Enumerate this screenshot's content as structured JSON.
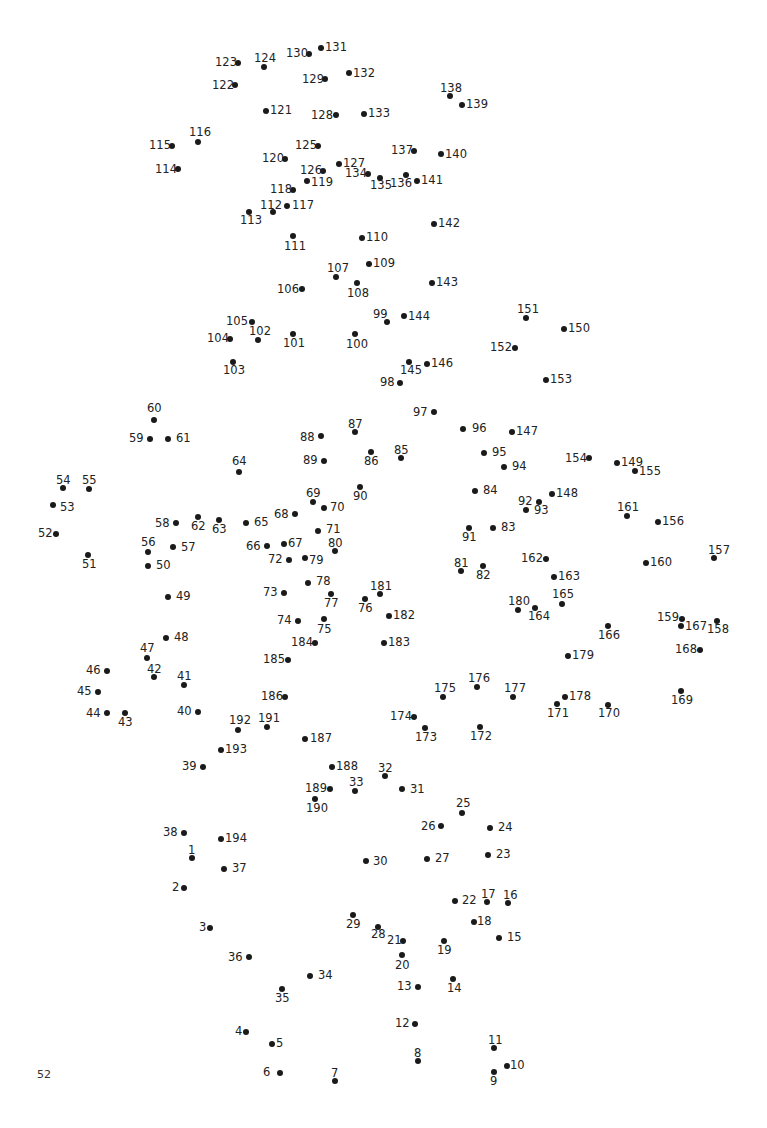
{
  "page": {
    "page_number": "52",
    "dot_color": "#1a1a1a",
    "text_color": "#222222"
  },
  "dots": [
    {
      "n": "1",
      "x": 192,
      "y": 858,
      "lx": 188,
      "ly": 845
    },
    {
      "n": "2",
      "x": 184,
      "y": 888,
      "lx": 172,
      "ly": 882
    },
    {
      "n": "3",
      "x": 210,
      "y": 928,
      "lx": 199,
      "ly": 922
    },
    {
      "n": "4",
      "x": 246,
      "y": 1032,
      "lx": 235,
      "ly": 1026
    },
    {
      "n": "5",
      "x": 272,
      "y": 1044,
      "lx": 276,
      "ly": 1038
    },
    {
      "n": "6",
      "x": 280,
      "y": 1073,
      "lx": 263,
      "ly": 1067
    },
    {
      "n": "7",
      "x": 335,
      "y": 1081,
      "lx": 331,
      "ly": 1068
    },
    {
      "n": "8",
      "x": 418,
      "y": 1061,
      "lx": 414,
      "ly": 1048
    },
    {
      "n": "9",
      "x": 494,
      "y": 1072,
      "lx": 490,
      "ly": 1076
    },
    {
      "n": "10",
      "x": 507,
      "y": 1066,
      "lx": 510,
      "ly": 1060
    },
    {
      "n": "11",
      "x": 494,
      "y": 1048,
      "lx": 488,
      "ly": 1035
    },
    {
      "n": "12",
      "x": 415,
      "y": 1024,
      "lx": 395,
      "ly": 1018
    },
    {
      "n": "13",
      "x": 418,
      "y": 987,
      "lx": 397,
      "ly": 981
    },
    {
      "n": "14",
      "x": 453,
      "y": 979,
      "lx": 447,
      "ly": 983
    },
    {
      "n": "15",
      "x": 499,
      "y": 938,
      "lx": 507,
      "ly": 932
    },
    {
      "n": "16",
      "x": 508,
      "y": 903,
      "lx": 503,
      "ly": 890
    },
    {
      "n": "17",
      "x": 487,
      "y": 902,
      "lx": 481,
      "ly": 889
    },
    {
      "n": "18",
      "x": 474,
      "y": 922,
      "lx": 477,
      "ly": 916
    },
    {
      "n": "19",
      "x": 444,
      "y": 941,
      "lx": 437,
      "ly": 945
    },
    {
      "n": "20",
      "x": 402,
      "y": 955,
      "lx": 395,
      "ly": 960
    },
    {
      "n": "21",
      "x": 403,
      "y": 941,
      "lx": 387,
      "ly": 935
    },
    {
      "n": "22",
      "x": 455,
      "y": 901,
      "lx": 462,
      "ly": 895
    },
    {
      "n": "23",
      "x": 488,
      "y": 855,
      "lx": 496,
      "ly": 849
    },
    {
      "n": "24",
      "x": 490,
      "y": 828,
      "lx": 498,
      "ly": 822
    },
    {
      "n": "25",
      "x": 462,
      "y": 813,
      "lx": 456,
      "ly": 798
    },
    {
      "n": "26",
      "x": 441,
      "y": 826,
      "lx": 421,
      "ly": 821
    },
    {
      "n": "27",
      "x": 427,
      "y": 859,
      "lx": 435,
      "ly": 853
    },
    {
      "n": "28",
      "x": 378,
      "y": 927,
      "lx": 371,
      "ly": 929
    },
    {
      "n": "29",
      "x": 353,
      "y": 915,
      "lx": 346,
      "ly": 919
    },
    {
      "n": "30",
      "x": 366,
      "y": 861,
      "lx": 373,
      "ly": 856
    },
    {
      "n": "31",
      "x": 402,
      "y": 789,
      "lx": 410,
      "ly": 784
    },
    {
      "n": "32",
      "x": 385,
      "y": 776,
      "lx": 378,
      "ly": 763
    },
    {
      "n": "33",
      "x": 355,
      "y": 791,
      "lx": 349,
      "ly": 777
    },
    {
      "n": "34",
      "x": 310,
      "y": 976,
      "lx": 318,
      "ly": 970
    },
    {
      "n": "35",
      "x": 282,
      "y": 989,
      "lx": 275,
      "ly": 993
    },
    {
      "n": "36",
      "x": 249,
      "y": 957,
      "lx": 228,
      "ly": 952
    },
    {
      "n": "37",
      "x": 224,
      "y": 869,
      "lx": 232,
      "ly": 863
    },
    {
      "n": "38",
      "x": 184,
      "y": 833,
      "lx": 163,
      "ly": 827
    },
    {
      "n": "39",
      "x": 203,
      "y": 767,
      "lx": 182,
      "ly": 761
    },
    {
      "n": "40",
      "x": 198,
      "y": 712,
      "lx": 177,
      "ly": 706
    },
    {
      "n": "41",
      "x": 184,
      "y": 685,
      "lx": 177,
      "ly": 671
    },
    {
      "n": "42",
      "x": 154,
      "y": 677,
      "lx": 147,
      "ly": 664
    },
    {
      "n": "43",
      "x": 125,
      "y": 713,
      "lx": 118,
      "ly": 717
    },
    {
      "n": "44",
      "x": 107,
      "y": 713,
      "lx": 86,
      "ly": 708
    },
    {
      "n": "45",
      "x": 98,
      "y": 692,
      "lx": 77,
      "ly": 686
    },
    {
      "n": "46",
      "x": 107,
      "y": 671,
      "lx": 86,
      "ly": 665
    },
    {
      "n": "47",
      "x": 147,
      "y": 658,
      "lx": 140,
      "ly": 643
    },
    {
      "n": "48",
      "x": 166,
      "y": 638,
      "lx": 174,
      "ly": 632
    },
    {
      "n": "49",
      "x": 168,
      "y": 597,
      "lx": 176,
      "ly": 591
    },
    {
      "n": "50",
      "x": 148,
      "y": 566,
      "lx": 156,
      "ly": 560
    },
    {
      "n": "51",
      "x": 88,
      "y": 555,
      "lx": 82,
      "ly": 559
    },
    {
      "n": "52",
      "x": 56,
      "y": 534,
      "lx": 38,
      "ly": 528
    },
    {
      "n": "53",
      "x": 53,
      "y": 505,
      "lx": 60,
      "ly": 502
    },
    {
      "n": "54",
      "x": 63,
      "y": 488,
      "lx": 56,
      "ly": 475
    },
    {
      "n": "55",
      "x": 89,
      "y": 489,
      "lx": 82,
      "ly": 475
    },
    {
      "n": "56",
      "x": 148,
      "y": 552,
      "lx": 141,
      "ly": 537
    },
    {
      "n": "57",
      "x": 173,
      "y": 547,
      "lx": 181,
      "ly": 542
    },
    {
      "n": "58",
      "x": 176,
      "y": 523,
      "lx": 155,
      "ly": 518
    },
    {
      "n": "59",
      "x": 150,
      "y": 439,
      "lx": 129,
      "ly": 433
    },
    {
      "n": "60",
      "x": 154,
      "y": 420,
      "lx": 147,
      "ly": 403
    },
    {
      "n": "61",
      "x": 168,
      "y": 439,
      "lx": 176,
      "ly": 433
    },
    {
      "n": "62",
      "x": 198,
      "y": 517,
      "lx": 191,
      "ly": 521
    },
    {
      "n": "63",
      "x": 219,
      "y": 520,
      "lx": 212,
      "ly": 524
    },
    {
      "n": "64",
      "x": 239,
      "y": 472,
      "lx": 232,
      "ly": 456
    },
    {
      "n": "65",
      "x": 246,
      "y": 523,
      "lx": 254,
      "ly": 517
    },
    {
      "n": "66",
      "x": 267,
      "y": 546,
      "lx": 246,
      "ly": 541
    },
    {
      "n": "67",
      "x": 284,
      "y": 544,
      "lx": 288,
      "ly": 538
    },
    {
      "n": "68",
      "x": 295,
      "y": 514,
      "lx": 274,
      "ly": 509
    },
    {
      "n": "69",
      "x": 313,
      "y": 502,
      "lx": 306,
      "ly": 488
    },
    {
      "n": "70",
      "x": 324,
      "y": 508,
      "lx": 330,
      "ly": 502
    },
    {
      "n": "71",
      "x": 318,
      "y": 531,
      "lx": 326,
      "ly": 524
    },
    {
      "n": "72",
      "x": 289,
      "y": 560,
      "lx": 268,
      "ly": 554
    },
    {
      "n": "73",
      "x": 284,
      "y": 593,
      "lx": 263,
      "ly": 587
    },
    {
      "n": "74",
      "x": 298,
      "y": 621,
      "lx": 277,
      "ly": 615
    },
    {
      "n": "75",
      "x": 324,
      "y": 619,
      "lx": 317,
      "ly": 624
    },
    {
      "n": "76",
      "x": 365,
      "y": 599,
      "lx": 358,
      "ly": 603
    },
    {
      "n": "77",
      "x": 331,
      "y": 594,
      "lx": 324,
      "ly": 598
    },
    {
      "n": "78",
      "x": 308,
      "y": 583,
      "lx": 316,
      "ly": 576
    },
    {
      "n": "79",
      "x": 305,
      "y": 558,
      "lx": 309,
      "ly": 555
    },
    {
      "n": "80",
      "x": 335,
      "y": 551,
      "lx": 328,
      "ly": 538
    },
    {
      "n": "81",
      "x": 461,
      "y": 571,
      "lx": 454,
      "ly": 558
    },
    {
      "n": "82",
      "x": 483,
      "y": 566,
      "lx": 476,
      "ly": 570
    },
    {
      "n": "83",
      "x": 493,
      "y": 528,
      "lx": 501,
      "ly": 522
    },
    {
      "n": "84",
      "x": 475,
      "y": 491,
      "lx": 483,
      "ly": 485
    },
    {
      "n": "85",
      "x": 401,
      "y": 458,
      "lx": 394,
      "ly": 445
    },
    {
      "n": "86",
      "x": 371,
      "y": 452,
      "lx": 364,
      "ly": 456
    },
    {
      "n": "87",
      "x": 355,
      "y": 432,
      "lx": 348,
      "ly": 419
    },
    {
      "n": "88",
      "x": 321,
      "y": 436,
      "lx": 300,
      "ly": 432
    },
    {
      "n": "89",
      "x": 324,
      "y": 461,
      "lx": 303,
      "ly": 455
    },
    {
      "n": "90",
      "x": 360,
      "y": 487,
      "lx": 353,
      "ly": 491
    },
    {
      "n": "91",
      "x": 469,
      "y": 528,
      "lx": 462,
      "ly": 532
    },
    {
      "n": "92",
      "x": 539,
      "y": 502,
      "lx": 518,
      "ly": 496
    },
    {
      "n": "93",
      "x": 526,
      "y": 510,
      "lx": 534,
      "ly": 505
    },
    {
      "n": "94",
      "x": 504,
      "y": 467,
      "lx": 512,
      "ly": 461
    },
    {
      "n": "95",
      "x": 484,
      "y": 453,
      "lx": 492,
      "ly": 447
    },
    {
      "n": "96",
      "x": 463,
      "y": 429,
      "lx": 472,
      "ly": 423
    },
    {
      "n": "97",
      "x": 434,
      "y": 412,
      "lx": 413,
      "ly": 407
    },
    {
      "n": "98",
      "x": 400,
      "y": 383,
      "lx": 380,
      "ly": 377
    },
    {
      "n": "99",
      "x": 387,
      "y": 322,
      "lx": 373,
      "ly": 309
    },
    {
      "n": "100",
      "x": 355,
      "y": 334,
      "lx": 346,
      "ly": 339
    },
    {
      "n": "101",
      "x": 293,
      "y": 334,
      "lx": 283,
      "ly": 338
    },
    {
      "n": "102",
      "x": 258,
      "y": 340,
      "lx": 249,
      "ly": 326
    },
    {
      "n": "103",
      "x": 233,
      "y": 362,
      "lx": 223,
      "ly": 365
    },
    {
      "n": "104",
      "x": 230,
      "y": 339,
      "lx": 207,
      "ly": 333
    },
    {
      "n": "105",
      "x": 252,
      "y": 322,
      "lx": 226,
      "ly": 316
    },
    {
      "n": "106",
      "x": 302,
      "y": 289,
      "lx": 277,
      "ly": 284
    },
    {
      "n": "107",
      "x": 336,
      "y": 277,
      "lx": 327,
      "ly": 263
    },
    {
      "n": "108",
      "x": 357,
      "y": 283,
      "lx": 347,
      "ly": 288
    },
    {
      "n": "109",
      "x": 369,
      "y": 264,
      "lx": 373,
      "ly": 258
    },
    {
      "n": "110",
      "x": 362,
      "y": 238,
      "lx": 366,
      "ly": 232
    },
    {
      "n": "111",
      "x": 293,
      "y": 236,
      "lx": 284,
      "ly": 241
    },
    {
      "n": "112",
      "x": 273,
      "y": 212,
      "lx": 260,
      "ly": 200
    },
    {
      "n": "113",
      "x": 249,
      "y": 212,
      "lx": 240,
      "ly": 215
    },
    {
      "n": "114",
      "x": 178,
      "y": 169,
      "lx": 155,
      "ly": 164
    },
    {
      "n": "115",
      "x": 172,
      "y": 146,
      "lx": 149,
      "ly": 140
    },
    {
      "n": "116",
      "x": 198,
      "y": 142,
      "lx": 189,
      "ly": 127
    },
    {
      "n": "117",
      "x": 287,
      "y": 206,
      "lx": 292,
      "ly": 200
    },
    {
      "n": "118",
      "x": 293,
      "y": 190,
      "lx": 270,
      "ly": 184
    },
    {
      "n": "119",
      "x": 307,
      "y": 181,
      "lx": 311,
      "ly": 177
    },
    {
      "n": "120",
      "x": 285,
      "y": 159,
      "lx": 262,
      "ly": 153
    },
    {
      "n": "121",
      "x": 266,
      "y": 111,
      "lx": 270,
      "ly": 105
    },
    {
      "n": "122",
      "x": 235,
      "y": 85,
      "lx": 212,
      "ly": 80
    },
    {
      "n": "123",
      "x": 238,
      "y": 63,
      "lx": 215,
      "ly": 57
    },
    {
      "n": "124",
      "x": 264,
      "y": 67,
      "lx": 254,
      "ly": 53
    },
    {
      "n": "125",
      "x": 318,
      "y": 146,
      "lx": 295,
      "ly": 140
    },
    {
      "n": "126",
      "x": 323,
      "y": 171,
      "lx": 300,
      "ly": 165
    },
    {
      "n": "127",
      "x": 339,
      "y": 164,
      "lx": 343,
      "ly": 158
    },
    {
      "n": "128",
      "x": 336,
      "y": 115,
      "lx": 311,
      "ly": 110
    },
    {
      "n": "129",
      "x": 325,
      "y": 79,
      "lx": 302,
      "ly": 74
    },
    {
      "n": "130",
      "x": 309,
      "y": 54,
      "lx": 286,
      "ly": 48
    },
    {
      "n": "131",
      "x": 321,
      "y": 48,
      "lx": 325,
      "ly": 42
    },
    {
      "n": "132",
      "x": 349,
      "y": 73,
      "lx": 353,
      "ly": 68
    },
    {
      "n": "133",
      "x": 364,
      "y": 114,
      "lx": 368,
      "ly": 108
    },
    {
      "n": "134",
      "x": 368,
      "y": 174,
      "lx": 345,
      "ly": 168
    },
    {
      "n": "135",
      "x": 380,
      "y": 178,
      "lx": 370,
      "ly": 180
    },
    {
      "n": "136",
      "x": 406,
      "y": 175,
      "lx": 390,
      "ly": 178
    },
    {
      "n": "137",
      "x": 414,
      "y": 151,
      "lx": 391,
      "ly": 145
    },
    {
      "n": "138",
      "x": 450,
      "y": 96,
      "lx": 440,
      "ly": 83
    },
    {
      "n": "139",
      "x": 462,
      "y": 105,
      "lx": 466,
      "ly": 99
    },
    {
      "n": "140",
      "x": 441,
      "y": 154,
      "lx": 445,
      "ly": 149
    },
    {
      "n": "141",
      "x": 417,
      "y": 181,
      "lx": 421,
      "ly": 175
    },
    {
      "n": "142",
      "x": 434,
      "y": 224,
      "lx": 438,
      "ly": 218
    },
    {
      "n": "143",
      "x": 432,
      "y": 283,
      "lx": 436,
      "ly": 277
    },
    {
      "n": "144",
      "x": 404,
      "y": 316,
      "lx": 408,
      "ly": 311
    },
    {
      "n": "145",
      "x": 409,
      "y": 362,
      "lx": 400,
      "ly": 365
    },
    {
      "n": "146",
      "x": 427,
      "y": 364,
      "lx": 431,
      "ly": 358
    },
    {
      "n": "147",
      "x": 512,
      "y": 432,
      "lx": 516,
      "ly": 426
    },
    {
      "n": "148",
      "x": 552,
      "y": 494,
      "lx": 556,
      "ly": 488
    },
    {
      "n": "149",
      "x": 617,
      "y": 463,
      "lx": 621,
      "ly": 457
    },
    {
      "n": "150",
      "x": 564,
      "y": 329,
      "lx": 568,
      "ly": 323
    },
    {
      "n": "151",
      "x": 526,
      "y": 318,
      "lx": 517,
      "ly": 304
    },
    {
      "n": "152",
      "x": 515,
      "y": 348,
      "lx": 490,
      "ly": 342
    },
    {
      "n": "153",
      "x": 546,
      "y": 380,
      "lx": 550,
      "ly": 374
    },
    {
      "n": "154",
      "x": 589,
      "y": 458,
      "lx": 565,
      "ly": 453
    },
    {
      "n": "155",
      "x": 635,
      "y": 471,
      "lx": 639,
      "ly": 466
    },
    {
      "n": "156",
      "x": 658,
      "y": 522,
      "lx": 662,
      "ly": 516
    },
    {
      "n": "157",
      "x": 714,
      "y": 558,
      "lx": 708,
      "ly": 545
    },
    {
      "n": "158",
      "x": 717,
      "y": 621,
      "lx": 707,
      "ly": 624
    },
    {
      "n": "159",
      "x": 682,
      "y": 619,
      "lx": 657,
      "ly": 612
    },
    {
      "n": "160",
      "x": 646,
      "y": 563,
      "lx": 650,
      "ly": 557
    },
    {
      "n": "161",
      "x": 627,
      "y": 516,
      "lx": 617,
      "ly": 502
    },
    {
      "n": "162",
      "x": 546,
      "y": 559,
      "lx": 521,
      "ly": 553
    },
    {
      "n": "163",
      "x": 554,
      "y": 577,
      "lx": 558,
      "ly": 571
    },
    {
      "n": "164",
      "x": 535,
      "y": 608,
      "lx": 528,
      "ly": 611
    },
    {
      "n": "165",
      "x": 562,
      "y": 604,
      "lx": 552,
      "ly": 589
    },
    {
      "n": "166",
      "x": 608,
      "y": 626,
      "lx": 598,
      "ly": 630
    },
    {
      "n": "167",
      "x": 681,
      "y": 626,
      "lx": 685,
      "ly": 621
    },
    {
      "n": "168",
      "x": 700,
      "y": 650,
      "lx": 675,
      "ly": 644
    },
    {
      "n": "169",
      "x": 681,
      "y": 691,
      "lx": 671,
      "ly": 695
    },
    {
      "n": "170",
      "x": 608,
      "y": 705,
      "lx": 598,
      "ly": 708
    },
    {
      "n": "171",
      "x": 557,
      "y": 704,
      "lx": 547,
      "ly": 708
    },
    {
      "n": "172",
      "x": 480,
      "y": 727,
      "lx": 470,
      "ly": 731
    },
    {
      "n": "173",
      "x": 425,
      "y": 728,
      "lx": 415,
      "ly": 732
    },
    {
      "n": "174",
      "x": 414,
      "y": 717,
      "lx": 390,
      "ly": 711
    },
    {
      "n": "175",
      "x": 443,
      "y": 697,
      "lx": 434,
      "ly": 683
    },
    {
      "n": "176",
      "x": 477,
      "y": 687,
      "lx": 468,
      "ly": 673
    },
    {
      "n": "177",
      "x": 513,
      "y": 697,
      "lx": 504,
      "ly": 683
    },
    {
      "n": "178",
      "x": 565,
      "y": 697,
      "lx": 569,
      "ly": 691
    },
    {
      "n": "179",
      "x": 568,
      "y": 656,
      "lx": 572,
      "ly": 650
    },
    {
      "n": "180",
      "x": 518,
      "y": 610,
      "lx": 508,
      "ly": 596
    },
    {
      "n": "181",
      "x": 380,
      "y": 594,
      "lx": 370,
      "ly": 581
    },
    {
      "n": "182",
      "x": 389,
      "y": 616,
      "lx": 393,
      "ly": 610
    },
    {
      "n": "183",
      "x": 384,
      "y": 643,
      "lx": 388,
      "ly": 637
    },
    {
      "n": "184",
      "x": 315,
      "y": 643,
      "lx": 291,
      "ly": 637
    },
    {
      "n": "185",
      "x": 288,
      "y": 660,
      "lx": 263,
      "ly": 654
    },
    {
      "n": "186",
      "x": 285,
      "y": 697,
      "lx": 261,
      "ly": 691
    },
    {
      "n": "187",
      "x": 305,
      "y": 739,
      "lx": 310,
      "ly": 733
    },
    {
      "n": "188",
      "x": 332,
      "y": 767,
      "lx": 336,
      "ly": 761
    },
    {
      "n": "189",
      "x": 330,
      "y": 789,
      "lx": 305,
      "ly": 783
    },
    {
      "n": "190",
      "x": 315,
      "y": 799,
      "lx": 306,
      "ly": 803
    },
    {
      "n": "191",
      "x": 267,
      "y": 727,
      "lx": 258,
      "ly": 713
    },
    {
      "n": "192",
      "x": 238,
      "y": 730,
      "lx": 229,
      "ly": 715
    },
    {
      "n": "193",
      "x": 221,
      "y": 750,
      "lx": 225,
      "ly": 744
    },
    {
      "n": "194",
      "x": 221,
      "y": 839,
      "lx": 225,
      "ly": 833
    }
  ]
}
